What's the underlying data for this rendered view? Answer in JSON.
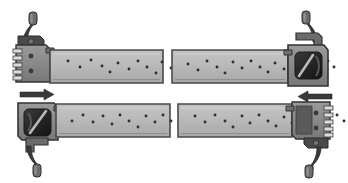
{
  "figure": {
    "title": "Connector strap assembly mating diagram",
    "background_color": "#ffffff",
    "width": 348,
    "height": 183
  },
  "palette": {
    "strap_fill": "#b4b4b4",
    "strap_edge": "#4c4c4c",
    "strap_highlight": "#c9c9c9",
    "body_fill": "#8a8a8a",
    "body_fill_dark": "#6e6e6e",
    "body_edge": "#3a3a3a",
    "cavity_dark": "#2b2b2b",
    "cavity_shadow": "#1c1c1c",
    "lever_fill": "#3d3d3d",
    "lever_knob": "#6a6a6a",
    "dot_color": "#2f2f2f",
    "arrow_color": "#3a3a3a",
    "contact_light": "#d8d8d8"
  },
  "rows": [
    {
      "id": "row-top",
      "label": "Upper assembly",
      "left_component": {
        "name": "plug-connector-left",
        "label": "Plug connector with latch lever",
        "lever_position": "up",
        "lever_label": "Latch lever"
      },
      "left_strap": {
        "name": "strap-top-left",
        "label": "Perforated strap segment",
        "dot_count": 19
      },
      "right_strap": {
        "name": "strap-top-right",
        "label": "Perforated strap segment",
        "dot_count": 19
      },
      "right_component": {
        "name": "socket-connector-right",
        "label": "Socket connector with latch lever",
        "lever_position": "up",
        "lever_label": "Latch lever"
      }
    },
    {
      "id": "row-bottom",
      "label": "Lower assembly",
      "left_component": {
        "name": "socket-connector-left",
        "label": "Socket connector with latch lever",
        "lever_position": "down",
        "lever_label": "Latch lever"
      },
      "left_strap": {
        "name": "strap-bottom-left",
        "label": "Perforated strap segment",
        "dot_count": 19
      },
      "right_strap": {
        "name": "strap-bottom-right",
        "label": "Perforated strap segment",
        "dot_count": 19
      },
      "right_component": {
        "name": "plug-connector-right",
        "label": "Plug connector with latch lever",
        "lever_position": "down",
        "lever_label": "Latch lever"
      }
    }
  ],
  "arrows": [
    {
      "id": "arrow-left",
      "label": "Insertion direction arrow pointing right",
      "direction": "right",
      "x": 20,
      "y": 92
    },
    {
      "id": "arrow-right",
      "label": "Insertion direction arrow pointing left",
      "direction": "left",
      "x": 292,
      "y": 96
    }
  ],
  "strap_dots": {
    "top_left": [
      [
        18,
        7
      ],
      [
        30,
        13
      ],
      [
        41,
        6
      ],
      [
        52,
        12
      ],
      [
        60,
        18
      ],
      [
        68,
        9
      ],
      [
        79,
        15
      ],
      [
        88,
        7
      ],
      [
        97,
        13
      ],
      [
        106,
        19
      ],
      [
        112,
        8
      ],
      [
        121,
        14
      ],
      [
        130,
        6
      ],
      [
        137,
        12
      ],
      [
        145,
        17
      ],
      [
        152,
        8
      ],
      [
        159,
        14
      ],
      [
        166,
        6
      ],
      [
        172,
        12
      ]
    ],
    "top_right": [
      [
        14,
        10
      ],
      [
        24,
        16
      ],
      [
        33,
        7
      ],
      [
        43,
        13
      ],
      [
        51,
        19
      ],
      [
        59,
        8
      ],
      [
        68,
        14
      ],
      [
        77,
        7
      ],
      [
        86,
        13
      ],
      [
        94,
        18
      ],
      [
        101,
        9
      ],
      [
        110,
        15
      ],
      [
        118,
        7
      ],
      [
        126,
        12
      ],
      [
        133,
        18
      ],
      [
        140,
        9
      ],
      [
        147,
        14
      ],
      [
        154,
        7
      ],
      [
        160,
        13
      ]
    ],
    "bottom_left": [
      [
        16,
        13
      ],
      [
        27,
        7
      ],
      [
        37,
        14
      ],
      [
        47,
        8
      ],
      [
        56,
        16
      ],
      [
        64,
        7
      ],
      [
        73,
        13
      ],
      [
        82,
        19
      ],
      [
        90,
        8
      ],
      [
        99,
        14
      ],
      [
        107,
        7
      ],
      [
        115,
        13
      ],
      [
        123,
        18
      ],
      [
        131,
        9
      ],
      [
        139,
        15
      ],
      [
        146,
        7
      ],
      [
        153,
        13
      ],
      [
        160,
        18
      ],
      [
        168,
        9
      ]
    ],
    "bottom_right": [
      [
        15,
        8
      ],
      [
        25,
        14
      ],
      [
        35,
        7
      ],
      [
        45,
        13
      ],
      [
        53,
        19
      ],
      [
        62,
        8
      ],
      [
        70,
        15
      ],
      [
        79,
        7
      ],
      [
        88,
        13
      ],
      [
        96,
        18
      ],
      [
        104,
        9
      ],
      [
        112,
        15
      ],
      [
        120,
        7
      ],
      [
        128,
        13
      ],
      [
        136,
        18
      ],
      [
        143,
        8
      ],
      [
        150,
        14
      ],
      [
        157,
        7
      ],
      [
        164,
        13
      ]
    ]
  }
}
